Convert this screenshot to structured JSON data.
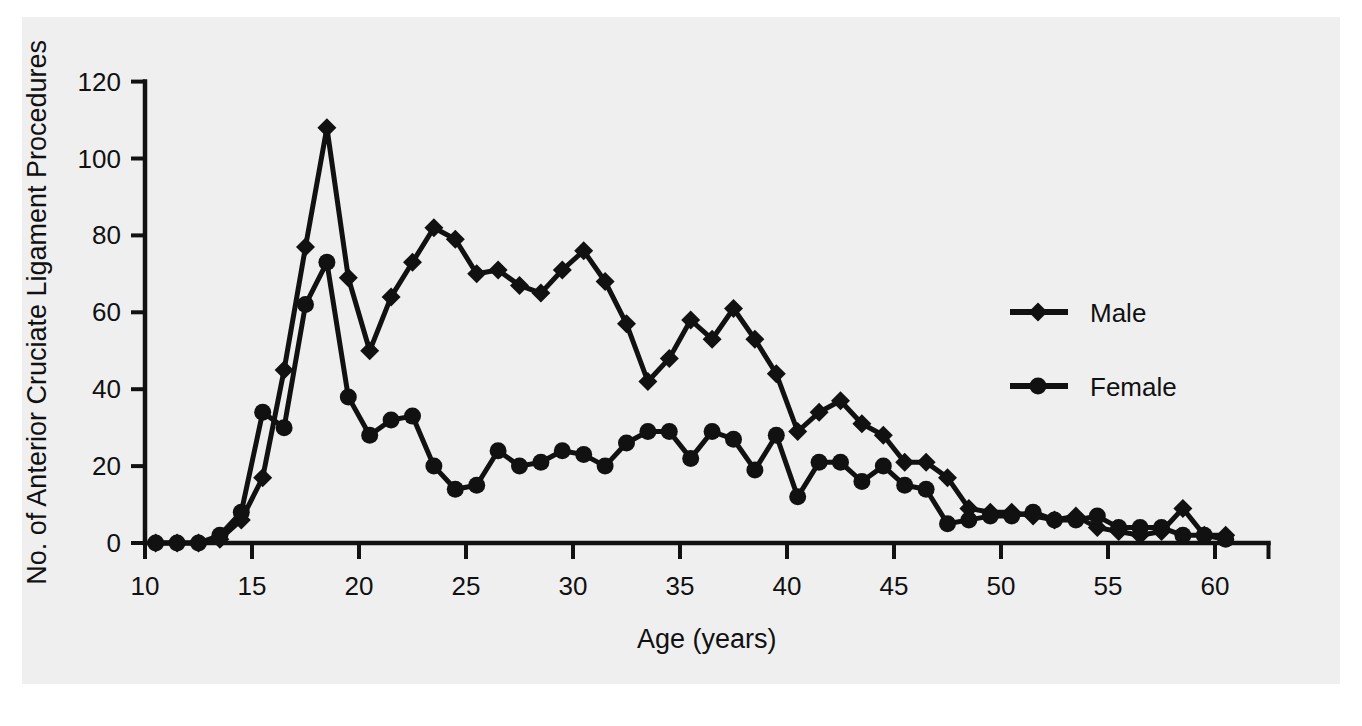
{
  "figure": {
    "background_color": "#efeff0",
    "ink_color": "#111111"
  },
  "legend": {
    "position": "right-middle",
    "entries": [
      {
        "label": "Male",
        "marker": "diamond"
      },
      {
        "label": "Female",
        "marker": "circle"
      }
    ]
  },
  "axes": {
    "x": {
      "title": "Age (years)",
      "ticks": [
        "10",
        "15",
        "20",
        "25",
        "30",
        "35",
        "40",
        "45",
        "50",
        "55",
        "60"
      ],
      "min": 10,
      "max": 62.5
    },
    "y": {
      "title": "No. of Anterior Cruciate Ligament Procedures",
      "ticks": [
        "0",
        "20",
        "40",
        "60",
        "80",
        "100",
        "120"
      ],
      "min": 0,
      "max": 120
    }
  },
  "chart_data": {
    "type": "line",
    "title": "",
    "xlabel": "Age (years)",
    "ylabel": "No. of Anterior Cruciate Ligament Procedures",
    "xlim": [
      10,
      62.5
    ],
    "ylim": [
      0,
      120
    ],
    "grid": false,
    "legend_position": "right",
    "x": [
      10.5,
      11.5,
      12.5,
      13.5,
      14.5,
      15.5,
      16.5,
      17.5,
      18.5,
      19.5,
      20.5,
      21.5,
      22.5,
      23.5,
      24.5,
      25.5,
      26.5,
      27.5,
      28.5,
      29.5,
      30.5,
      31.5,
      32.5,
      33.5,
      34.5,
      35.5,
      36.5,
      37.5,
      38.5,
      39.5,
      40.5,
      41.5,
      42.5,
      43.5,
      44.5,
      45.5,
      46.5,
      47.5,
      48.5,
      49.5,
      50.5,
      51.5,
      52.5,
      53.5,
      54.5,
      55.5,
      56.5,
      57.5,
      58.5,
      59.5,
      60.5
    ],
    "series": [
      {
        "name": "Male",
        "marker": "diamond",
        "values": [
          0,
          0,
          0,
          1,
          6,
          17,
          45,
          77,
          108,
          69,
          50,
          64,
          73,
          82,
          79,
          70,
          71,
          67,
          65,
          71,
          76,
          68,
          57,
          42,
          48,
          58,
          53,
          61,
          53,
          44,
          29,
          34,
          37,
          31,
          28,
          21,
          21,
          17,
          9,
          8,
          8,
          7,
          6,
          7,
          4,
          3,
          2,
          3,
          9,
          2,
          2
        ]
      },
      {
        "name": "Female",
        "marker": "circle",
        "values": [
          0,
          0,
          0,
          2,
          8,
          34,
          30,
          62,
          73,
          38,
          28,
          32,
          33,
          20,
          14,
          15,
          24,
          20,
          21,
          24,
          23,
          20,
          26,
          29,
          29,
          22,
          29,
          27,
          19,
          28,
          12,
          21,
          21,
          16,
          20,
          15,
          14,
          5,
          6,
          7,
          7,
          8,
          6,
          6,
          7,
          4,
          4,
          4,
          2,
          2,
          1
        ]
      }
    ]
  }
}
